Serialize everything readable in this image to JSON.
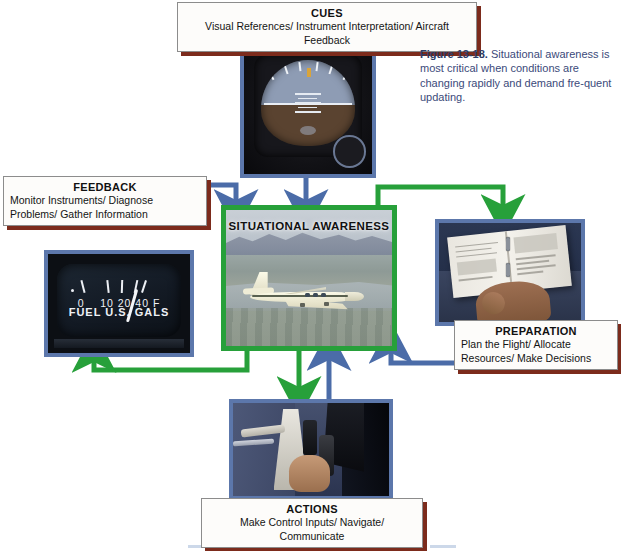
{
  "figure": {
    "caption_label": "Figure 13-18.",
    "caption_text": " Situational awareness is most critical when conditions are changing rapidly and demand fre-quent updating."
  },
  "center": {
    "title": "SITUATIONAL AWARENESS",
    "photo_alt": "light single-engine airplane in flight over mountainous terrain and water",
    "border_color": "#27a03a"
  },
  "boxes": {
    "cues": {
      "title": "CUES",
      "body": "Visual References/ Instrument Interpretation/ Aircraft Feedback",
      "photo_alt": "aircraft attitude indicator instrument"
    },
    "feedback": {
      "title": "FEEDBACK",
      "body": "Monitor Instruments/ Diagnose Problems/ Gather Information",
      "photo_alt": "fuel quantity gauge"
    },
    "preparation": {
      "title": "PREPARATION",
      "body": "Plan the Flight/ Allocate Resources/ Make Decisions",
      "photo_alt": "pilot hand holding an open ring-bound flight manual"
    },
    "actions": {
      "title": "ACTIONS",
      "body": "Make Control Inputs/ Navigate/ Communicate",
      "photo_alt": "pilot hand on the control yoke and throttle in the cockpit"
    }
  },
  "gauge": {
    "scale_labels": [
      "0",
      "10",
      "20",
      "40",
      "F"
    ],
    "caption": "FUEL  U.S. GALS"
  },
  "arrows": {
    "inbound_color": "#4b6ca8",
    "outbound_color": "#27a03a",
    "inbound_from": [
      "CUES",
      "FEEDBACK",
      "ACTIONS",
      "PREPARATION"
    ],
    "outbound_to": [
      "PREPARATION",
      "ACTIONS",
      "FEEDBACK"
    ]
  },
  "palette": {
    "box_shadow": "#7c2b1c",
    "photo_border": "#5c77ab",
    "caption_text": "#3b4a7a"
  }
}
